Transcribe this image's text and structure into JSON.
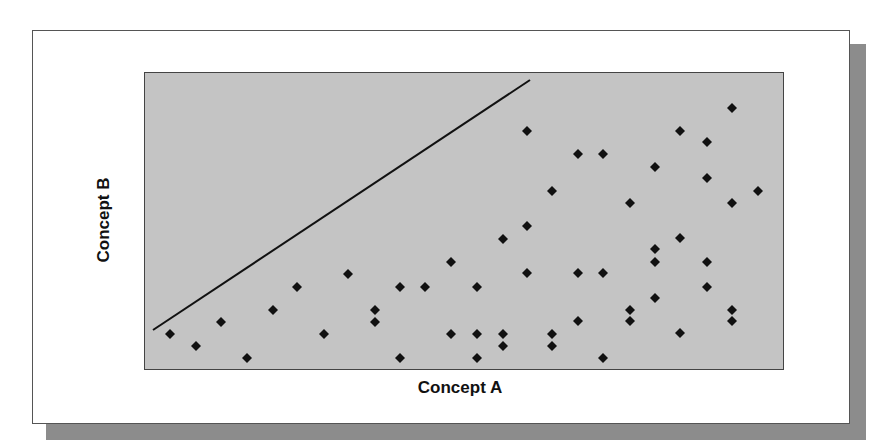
{
  "chart_data": {
    "type": "scatter",
    "title": "",
    "xlabel": "Concept A",
    "ylabel": "Concept B",
    "grid": false,
    "legend": null,
    "axis_ticks": false,
    "note": "No numeric ticks shown; coordinates are in plot-pixel units (x: 0 = left edge, y: 0 = bottom edge of plot area, width 640, height 298).",
    "xlim": [
      0,
      640
    ],
    "ylim": [
      0,
      298
    ],
    "reference_line": {
      "x1": 9,
      "y1": 40,
      "x2": 386,
      "y2": 290,
      "color": "#111111"
    },
    "points": [
      [
        26,
        36
      ],
      [
        52,
        24
      ],
      [
        77,
        48
      ],
      [
        103,
        12
      ],
      [
        129,
        60
      ],
      [
        153,
        83
      ],
      [
        180,
        36
      ],
      [
        204,
        96
      ],
      [
        231,
        60
      ],
      [
        231,
        48
      ],
      [
        256,
        83
      ],
      [
        256,
        12
      ],
      [
        281,
        83
      ],
      [
        307,
        108
      ],
      [
        307,
        36
      ],
      [
        333,
        83
      ],
      [
        333,
        36
      ],
      [
        333,
        12
      ],
      [
        359,
        131
      ],
      [
        359,
        36
      ],
      [
        359,
        24
      ],
      [
        383,
        239
      ],
      [
        383,
        144
      ],
      [
        383,
        97
      ],
      [
        408,
        179
      ],
      [
        408,
        36
      ],
      [
        408,
        24
      ],
      [
        434,
        216
      ],
      [
        434,
        97
      ],
      [
        434,
        49
      ],
      [
        459,
        216
      ],
      [
        459,
        97
      ],
      [
        459,
        12
      ],
      [
        486,
        167
      ],
      [
        486,
        60
      ],
      [
        486,
        49
      ],
      [
        511,
        203
      ],
      [
        511,
        121
      ],
      [
        511,
        108
      ],
      [
        511,
        72
      ],
      [
        536,
        239
      ],
      [
        536,
        132
      ],
      [
        536,
        37
      ],
      [
        563,
        228
      ],
      [
        563,
        192
      ],
      [
        563,
        108
      ],
      [
        563,
        83
      ],
      [
        588,
        262
      ],
      [
        588,
        167
      ],
      [
        588,
        60
      ],
      [
        588,
        49
      ],
      [
        614,
        179
      ]
    ],
    "marker": {
      "shape": "diamond",
      "color": "#111111",
      "size": 10
    },
    "colors": {
      "plot_bg": "#c4c4c4",
      "frame_bg": "#ffffff",
      "shadow": "#8c8c8c"
    }
  }
}
